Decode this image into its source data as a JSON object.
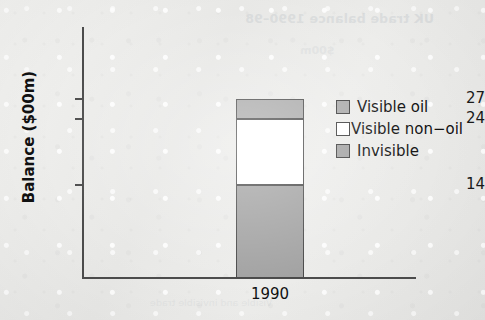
{
  "chart_data": {
    "type": "bar",
    "subtype": "stacked-bar",
    "title": "",
    "xlabel": "",
    "ylabel": "Balance ($00m)",
    "categories": [
      "1990"
    ],
    "ylim": [
      0,
      30
    ],
    "ytick_labels": [
      "27",
      "24",
      "14"
    ],
    "ytick_values": [
      27,
      24,
      14
    ],
    "grid": false,
    "legend_position": "right",
    "stack_order_bottom_to_top": [
      "Invisible",
      "Visible non-oil",
      "Visible oil"
    ],
    "series": [
      {
        "name": "Invisible",
        "values": [
          14
        ],
        "cumulative_top": [
          14
        ],
        "color": "#a3a3a3"
      },
      {
        "name": "Visible non-oil",
        "values": [
          10
        ],
        "cumulative_top": [
          24
        ],
        "color": "#ffffff"
      },
      {
        "name": "Visible oil",
        "values": [
          3
        ],
        "cumulative_top": [
          27
        ],
        "color": "#aaaaaa"
      }
    ],
    "total": 27,
    "annotations": []
  },
  "axes": {
    "y_title": "Balance ($00m)",
    "ticks": [
      {
        "label": "27",
        "value": 27
      },
      {
        "label": "24",
        "value": 24
      },
      {
        "label": "14",
        "value": 14
      }
    ],
    "x_tick_label": "1990"
  },
  "legend": {
    "items": [
      {
        "label": "Visible oil",
        "swatch_color": "#aaaaaa",
        "spacing": "wide"
      },
      {
        "label": "Visible non−oil",
        "swatch_color": "#ffffff",
        "spacing": "none"
      },
      {
        "label": "Invisible",
        "swatch_color": "#a3a3a3",
        "spacing": "wide"
      }
    ]
  },
  "artifacts": {
    "showthrough_line_1": "UK trade balance 1990–98",
    "showthrough_line_2": "$00m",
    "showthrough_line_3": "Visible and invisible trade"
  },
  "colors": {
    "background": "#ebebe9",
    "axis": "#4c4c4c",
    "text": "#111111",
    "segment_border": "#4a4a4a"
  }
}
